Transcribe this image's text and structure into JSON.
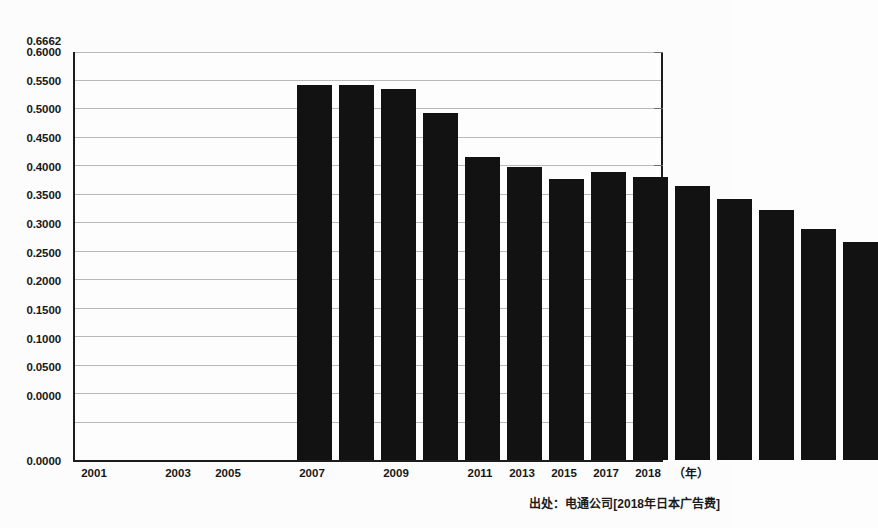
{
  "chart_data": {
    "type": "bar",
    "title": "",
    "subtitle": "",
    "xlabel": "（年）",
    "ylabel": "",
    "grid": true,
    "legend": null,
    "xlim": [
      2001,
      2018
    ],
    "ylim": [
      0.0,
      0.6662
    ],
    "y_ticks": [
      "0.6662",
      "0.6000",
      "0.5500",
      "0.5000",
      "0.4500",
      "0.4000",
      "0.3500",
      "0.3000",
      "0.2500",
      "0.2000",
      "0.1500",
      "0.1000",
      "0.0500",
      "0.0000"
    ],
    "y_tick_values": [
      0.6662,
      0.6,
      0.55,
      0.5,
      0.45,
      0.4,
      0.35,
      0.3,
      0.25,
      0.2,
      0.15,
      0.1,
      0.05,
      0.0
    ],
    "x_tick_labels": [
      "2001",
      "2003",
      "2005",
      "2007",
      "2009",
      "2011",
      "2013",
      "2015",
      "2017",
      "2018"
    ],
    "x_tick_values": [
      2001,
      2003,
      2005,
      2007,
      2009,
      2011,
      2013,
      2015,
      2017,
      2018
    ],
    "categories": [
      2001,
      2002,
      2003,
      2004,
      2005,
      2006,
      2007,
      2008,
      2009,
      2010,
      2011,
      2012,
      2013,
      2014,
      2015,
      2016,
      2017,
      2018
    ],
    "values": [
      null,
      null,
      null,
      null,
      0.6127,
      0.6127,
      0.605,
      0.5665,
      0.4945,
      0.4785,
      0.4585,
      0.4708,
      0.4617,
      0.447,
      0.4262,
      0.4086,
      0.3772,
      0.3566
    ],
    "bar_color": "#121212",
    "source": "出处：电通公司[2018年日本广告费]"
  },
  "axes": {
    "unit_label": "（年）"
  },
  "footer": {
    "source_text": "出处：电通公司[2018年日本广告费]"
  }
}
